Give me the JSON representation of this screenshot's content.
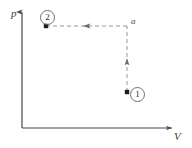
{
  "figure": {
    "background_color": "#ffffff",
    "width": 192,
    "height": 148
  },
  "axes": {
    "y_axis": {
      "name": "pressure-axis",
      "label": "p",
      "label_x": 11,
      "label_y": 8,
      "x": 22,
      "y_top": 12,
      "y_bottom": 128,
      "color": "#4a4a4a",
      "arrow": "up"
    },
    "x_axis": {
      "name": "volume-axis",
      "label": "V",
      "label_x": 174,
      "label_y": 131,
      "y": 128,
      "x_left": 22,
      "x_right": 172,
      "color": "#4a4a4a",
      "arrow": "right"
    }
  },
  "states": [
    {
      "id": "state-1",
      "label": "1",
      "dot_x": 127,
      "dot_y": 92,
      "label_x": 130,
      "label_y": 87
    },
    {
      "id": "state-2",
      "label": "2",
      "dot_x": 46,
      "dot_y": 26,
      "label_x": 40,
      "label_y": 10
    }
  ],
  "annotations": [
    {
      "id": "corner-a",
      "label": "a",
      "x": 131,
      "y": 17
    }
  ],
  "process_paths": [
    {
      "id": "isochoric-1-to-a",
      "name": "vertical-dashed-path",
      "style": "dashed",
      "color": "#8a8a8a",
      "from_x": 127,
      "from_y": 92,
      "to_x": 127,
      "to_y": 26,
      "arrow_direction": "up",
      "arrow_x": 127,
      "arrow_y": 63
    },
    {
      "id": "isobaric-a-to-2",
      "name": "horizontal-dashed-path",
      "style": "dashed",
      "color": "#8a8a8a",
      "from_x": 127,
      "from_y": 26,
      "to_x": 46,
      "to_y": 26,
      "arrow_direction": "left",
      "arrow_x": 88,
      "arrow_y": 26
    }
  ],
  "chart_data": {
    "type": "line",
    "title": "",
    "xlabel": "V",
    "ylabel": "p",
    "grid": false,
    "legend": null,
    "axis_arrows": true,
    "tick_labels": {
      "x": [],
      "y": []
    },
    "series": [
      {
        "name": "process 1 → a → 2",
        "style": "dashed",
        "points": [
          {
            "label": "1",
            "x": 127,
            "y": 92
          },
          {
            "label": "a",
            "x": 127,
            "y": 26
          },
          {
            "label": "2",
            "x": 46,
            "y": 26
          }
        ]
      }
    ],
    "annotations": [
      {
        "text": "1",
        "x": 127,
        "y": 92,
        "circled": true
      },
      {
        "text": "2",
        "x": 46,
        "y": 26,
        "circled": true
      },
      {
        "text": "a",
        "x": 131,
        "y": 22,
        "circled": false
      }
    ]
  }
}
